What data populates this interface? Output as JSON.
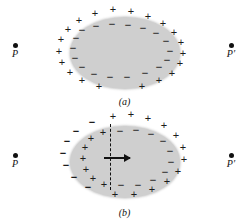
{
  "figure": {
    "background_color": "#ffffff",
    "body_fill_color": "#cfcfcf",
    "ink_color": "#111111"
  },
  "symbols": {
    "plus": "+",
    "minus": "−",
    "point_p": "P",
    "point_p_prime": "P′"
  },
  "panels": [
    {
      "id": "a",
      "caption": "(a)",
      "body_shape": "ellipse",
      "description": "Negative charges on the inner surface of the body, positive charges distributed outside",
      "field_points": [
        {
          "name": "P",
          "label": "P",
          "side": "left"
        },
        {
          "name": "P-prime",
          "label": "P′",
          "side": "right"
        }
      ],
      "inner_charges": {
        "sign": "minus",
        "count": 18,
        "placement": "along inner perimeter of ellipse"
      },
      "outer_charges": {
        "sign": "plus",
        "count": 20,
        "placement": "ring outside ellipse"
      },
      "outer_plus_positions": [
        {
          "x": 113,
          "y": 9
        },
        {
          "x": 131,
          "y": 11
        },
        {
          "x": 95,
          "y": 13
        },
        {
          "x": 148,
          "y": 16
        },
        {
          "x": 79,
          "y": 20
        },
        {
          "x": 163,
          "y": 23
        },
        {
          "x": 68,
          "y": 29
        },
        {
          "x": 174,
          "y": 32
        },
        {
          "x": 61,
          "y": 39
        },
        {
          "x": 181,
          "y": 42
        },
        {
          "x": 59,
          "y": 51
        },
        {
          "x": 183,
          "y": 53
        },
        {
          "x": 62,
          "y": 62
        },
        {
          "x": 180,
          "y": 63
        },
        {
          "x": 70,
          "y": 72
        },
        {
          "x": 172,
          "y": 73
        },
        {
          "x": 82,
          "y": 80
        },
        {
          "x": 159,
          "y": 80
        },
        {
          "x": 99,
          "y": 86
        },
        {
          "x": 142,
          "y": 86
        }
      ],
      "inner_minus_positions": [
        {
          "x": 112,
          "y": 24
        },
        {
          "x": 128,
          "y": 25
        },
        {
          "x": 96,
          "y": 26
        },
        {
          "x": 143,
          "y": 28
        },
        {
          "x": 82,
          "y": 30
        },
        {
          "x": 156,
          "y": 33
        },
        {
          "x": 76,
          "y": 38
        },
        {
          "x": 166,
          "y": 41
        },
        {
          "x": 73,
          "y": 48
        },
        {
          "x": 170,
          "y": 51
        },
        {
          "x": 75,
          "y": 58
        },
        {
          "x": 167,
          "y": 60
        },
        {
          "x": 82,
          "y": 67
        },
        {
          "x": 159,
          "y": 67
        },
        {
          "x": 94,
          "y": 74
        },
        {
          "x": 110,
          "y": 77
        },
        {
          "x": 127,
          "y": 77
        },
        {
          "x": 145,
          "y": 73
        }
      ]
    },
    {
      "id": "b",
      "caption": "(b)",
      "body_shape": "ellipse",
      "description": "Polarized body: negative charges outside the left edge, positive charges inside the left lobe, dashed dividing line with a displacement arrow pointing right, negative charges inside the right lobe and positive charges outside the right edge",
      "field_points": [
        {
          "name": "P",
          "label": "P",
          "side": "left"
        },
        {
          "name": "P-prime",
          "label": "P′",
          "side": "right"
        }
      ],
      "divider": {
        "style": "dashed",
        "orientation": "vertical",
        "x": 110,
        "y_top": 16,
        "y_bottom": 82
      },
      "arrow": {
        "name": "displacement-arrow",
        "direction": "right",
        "x_start": 104,
        "x_end": 130,
        "y": 50
      },
      "left_outer_minus_positions": [
        {
          "x": 92,
          "y": 14
        },
        {
          "x": 76,
          "y": 23
        },
        {
          "x": 67,
          "y": 33
        },
        {
          "x": 63,
          "y": 45
        },
        {
          "x": 66,
          "y": 57
        },
        {
          "x": 74,
          "y": 69
        },
        {
          "x": 88,
          "y": 79
        }
      ],
      "left_inner_plus_positions": [
        {
          "x": 103,
          "y": 24
        },
        {
          "x": 91,
          "y": 30
        },
        {
          "x": 85,
          "y": 39
        },
        {
          "x": 83,
          "y": 50
        },
        {
          "x": 86,
          "y": 61
        },
        {
          "x": 93,
          "y": 70
        },
        {
          "x": 104,
          "y": 76
        }
      ],
      "right_inner_minus_positions": [
        {
          "x": 120,
          "y": 23
        },
        {
          "x": 136,
          "y": 22
        },
        {
          "x": 151,
          "y": 26
        },
        {
          "x": 163,
          "y": 33
        },
        {
          "x": 170,
          "y": 43
        },
        {
          "x": 171,
          "y": 54
        },
        {
          "x": 165,
          "y": 64
        },
        {
          "x": 153,
          "y": 72
        },
        {
          "x": 138,
          "y": 77
        },
        {
          "x": 121,
          "y": 77
        }
      ],
      "right_outer_plus_positions": [
        {
          "x": 113,
          "y": 8
        },
        {
          "x": 131,
          "y": 6
        },
        {
          "x": 148,
          "y": 10
        },
        {
          "x": 164,
          "y": 17
        },
        {
          "x": 176,
          "y": 27
        },
        {
          "x": 183,
          "y": 39
        },
        {
          "x": 184,
          "y": 51
        },
        {
          "x": 178,
          "y": 63
        },
        {
          "x": 167,
          "y": 73
        },
        {
          "x": 152,
          "y": 81
        },
        {
          "x": 134,
          "y": 86
        },
        {
          "x": 115,
          "y": 86
        }
      ],
      "far_outer_minus_positions": []
    }
  ],
  "field_point_layout": {
    "left_x": 15,
    "right_x": 231,
    "panel_a_y": 46,
    "panel_b_y": 48
  }
}
